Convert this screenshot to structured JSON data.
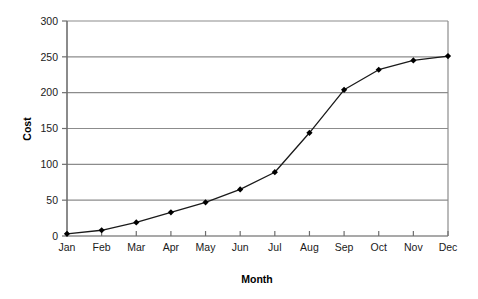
{
  "chart_data": {
    "type": "line",
    "title": "",
    "subtitle": "",
    "xlabel": "Month",
    "ylabel": "Cost",
    "categories": [
      "Jan",
      "Feb",
      "Mar",
      "Apr",
      "May",
      "Jun",
      "Jul",
      "Aug",
      "Sep",
      "Oct",
      "Nov",
      "Dec"
    ],
    "values": [
      3,
      8,
      19,
      33,
      47,
      65,
      89,
      144,
      204,
      232,
      245,
      251
    ],
    "series": [
      {
        "name": "Cost",
        "values": [
          3,
          8,
          19,
          33,
          47,
          65,
          89,
          144,
          204,
          232,
          245,
          251
        ]
      }
    ],
    "ylim": [
      0,
      300
    ],
    "ytick_labels": [
      "0",
      "50",
      "100",
      "150",
      "200",
      "250",
      "300"
    ],
    "ytick_values": [
      0,
      50,
      100,
      150,
      200,
      250,
      300
    ],
    "grid": "horizontal",
    "legend": "none",
    "marker": "diamond",
    "line_color": "#1a1a1a",
    "marker_color": "#000000",
    "grid_color": "#8c8c8c",
    "axis_color": "#6e6e6e",
    "background_color": "#ffffff"
  },
  "axes": {
    "y_title": "Cost",
    "x_title": "Month"
  }
}
